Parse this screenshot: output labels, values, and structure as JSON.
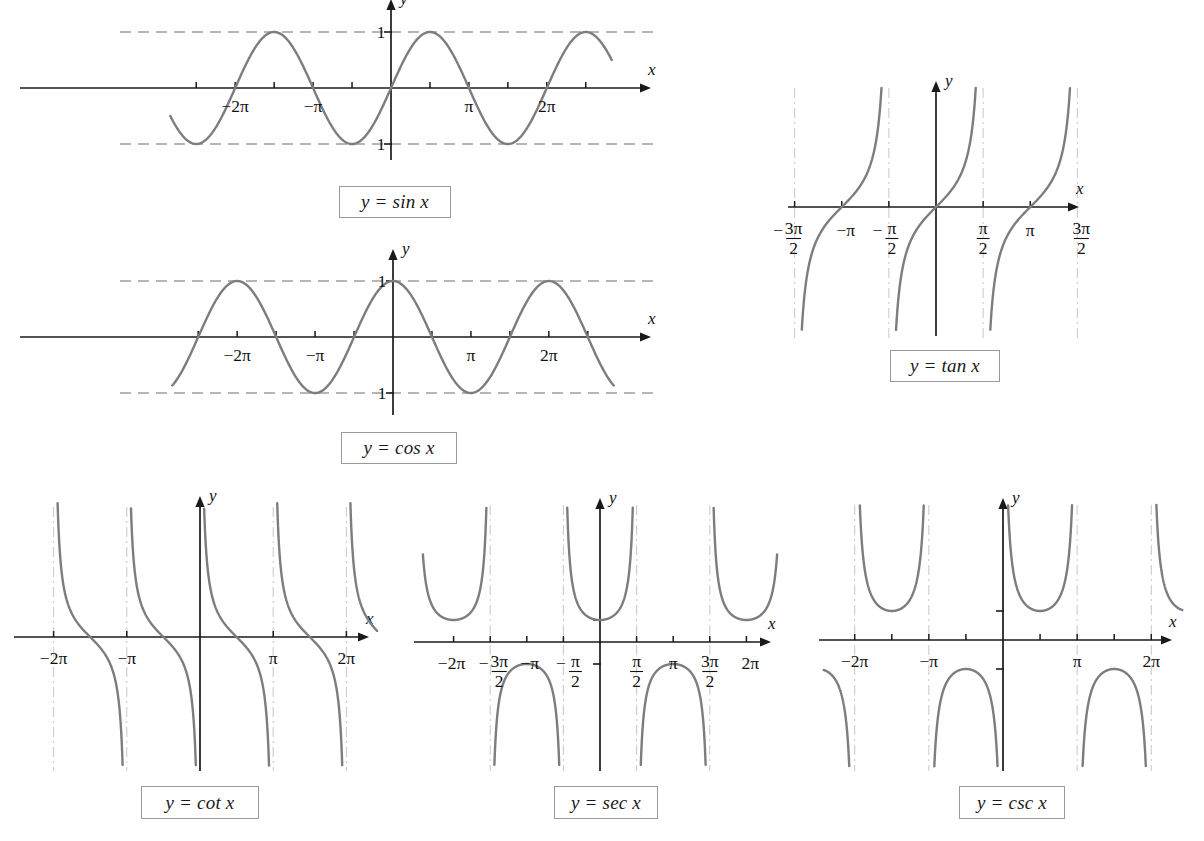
{
  "page": {
    "background": "#ffffff",
    "curve_color": "#7d7d7d",
    "axis_color": "#1a1a1a",
    "asymptote_color": "#c8c8c8",
    "dash_color": "#9d9d9d",
    "width": 1204,
    "height": 841
  },
  "figures": [
    {
      "id": "sine",
      "label": "y = sin x",
      "x_axis_letter": "x",
      "y_axis_letter": "y",
      "tick_labels": [
        "−2π",
        "−π",
        "π",
        "2π"
      ],
      "y_tick_labels": [
        "1",
        "−1"
      ]
    },
    {
      "id": "cosine",
      "label": "y = cos x",
      "x_axis_letter": "x",
      "y_axis_letter": "y",
      "tick_labels": [
        "−2π",
        "−π",
        "π",
        "2π"
      ],
      "y_tick_labels": [
        "1",
        "−1"
      ]
    },
    {
      "id": "tangent",
      "label": "y = tan x",
      "x_axis_letter": "x",
      "y_axis_letter": "y",
      "tick_labels": [
        "− 3π/2",
        "−π",
        "− π/2",
        "π/2",
        "π",
        "3π/2"
      ]
    },
    {
      "id": "cotangent",
      "label": "y = cot x",
      "x_axis_letter": "x",
      "y_axis_letter": "y",
      "tick_labels": [
        "−2π",
        "−π",
        "π",
        "2π"
      ]
    },
    {
      "id": "secant",
      "label": "y = sec x",
      "x_axis_letter": "x",
      "y_axis_letter": "y",
      "tick_labels": [
        "−2π",
        "− 3π/2",
        "−π",
        "− π/2",
        "π/2",
        "π",
        "3π/2",
        "2π"
      ]
    },
    {
      "id": "cosecant",
      "label": "y = csc x",
      "x_axis_letter": "x",
      "y_axis_letter": "y",
      "tick_labels": [
        "−2π",
        "−π",
        "π",
        "2π"
      ]
    }
  ],
  "chart_data": [
    {
      "type": "line",
      "id": "sine",
      "title": "y = sin x",
      "function": "sin",
      "xlabel": "x",
      "ylabel": "y",
      "xlim": [
        -8.9,
        8.9
      ],
      "ylim": [
        -1.6,
        1.6
      ],
      "xticks": [
        -7.854,
        -6.283,
        -4.712,
        -3.142,
        -1.571,
        1.571,
        3.142,
        4.712,
        6.283,
        7.854
      ],
      "xtick_labels": [
        "",
        "−2π",
        "",
        "−π",
        "",
        "",
        "π",
        "",
        "2π",
        ""
      ],
      "yticks": [
        -1,
        1
      ],
      "ytick_labels": [
        "−1",
        "1"
      ],
      "guide_lines": [
        1,
        -1
      ],
      "guide_style": "dashed",
      "asymptotes": [],
      "grid": false,
      "legend": false,
      "zeros": [
        -6.283,
        -3.142,
        0,
        3.142,
        6.283
      ],
      "maxima": [
        -4.712,
        1.571,
        7.854
      ],
      "minima": [
        -7.854,
        -1.571,
        4.712
      ]
    },
    {
      "type": "line",
      "id": "cosine",
      "title": "y = cos x",
      "function": "cos",
      "xlabel": "x",
      "ylabel": "y",
      "xlim": [
        -8.9,
        8.9
      ],
      "ylim": [
        -1.6,
        1.6
      ],
      "xticks": [
        -7.854,
        -6.283,
        -4.712,
        -3.142,
        -1.571,
        1.571,
        3.142,
        4.712,
        6.283,
        7.854
      ],
      "xtick_labels": [
        "",
        "−2π",
        "",
        "−π",
        "",
        "",
        "π",
        "",
        "2π",
        ""
      ],
      "yticks": [
        -1,
        1
      ],
      "ytick_labels": [
        "−1",
        "1"
      ],
      "guide_lines": [
        1,
        -1
      ],
      "guide_style": "dashed",
      "asymptotes": [],
      "grid": false,
      "legend": false,
      "zeros": [
        -7.854,
        -4.712,
        -1.571,
        1.571,
        4.712,
        7.854
      ],
      "maxima": [
        -6.283,
        0,
        6.283
      ],
      "minima": [
        -3.142,
        3.142
      ]
    },
    {
      "type": "line",
      "id": "tangent",
      "title": "y = tan x",
      "function": "tan",
      "xlabel": "x",
      "ylabel": "y",
      "xlim": [
        -5.3,
        5.3
      ],
      "ylim": [
        -4.7,
        4.7
      ],
      "xticks": [
        -4.712,
        -3.142,
        -1.571,
        1.571,
        3.142,
        4.712
      ],
      "xtick_labels": [
        "− 3π/2",
        "−π",
        "− π/2",
        "π/2",
        "π",
        "3π/2"
      ],
      "yticks": [],
      "ytick_labels": [],
      "guide_lines": [],
      "asymptotes": [
        -4.712,
        -1.571,
        1.571,
        4.712
      ],
      "grid": false,
      "legend": false,
      "zeros": [
        -3.142,
        0,
        3.142
      ]
    },
    {
      "type": "line",
      "id": "cotangent",
      "title": "y = cot x",
      "function": "cot",
      "xlabel": "x",
      "ylabel": "y",
      "xlim": [
        -7.6,
        7.6
      ],
      "ylim": [
        -4.6,
        4.6
      ],
      "xticks": [
        -6.283,
        -3.142,
        3.142,
        6.283
      ],
      "xtick_labels": [
        "−2π",
        "−π",
        "π",
        "2π"
      ],
      "yticks": [],
      "ytick_labels": [],
      "guide_lines": [],
      "asymptotes": [
        -6.283,
        -3.142,
        0,
        3.142,
        6.283
      ],
      "grid": false,
      "legend": false,
      "zeros": [
        -4.712,
        -1.571,
        1.571,
        4.712
      ]
    },
    {
      "type": "line",
      "id": "secant",
      "title": "y = sec x",
      "function": "sec",
      "xlabel": "x",
      "ylabel": "y",
      "xlim": [
        -7.6,
        7.6
      ],
      "ylim": [
        -5.2,
        5.2
      ],
      "xticks": [
        -6.283,
        -4.712,
        -3.142,
        -1.571,
        1.571,
        3.142,
        4.712,
        6.283
      ],
      "xtick_labels": [
        "−2π",
        "− 3π/2",
        "−π",
        "− π/2",
        "π/2",
        "π",
        "3π/2",
        "2π"
      ],
      "yticks": [
        -1,
        1
      ],
      "ytick_labels": [
        "",
        ""
      ],
      "guide_lines": [],
      "asymptotes": [
        -4.712,
        -1.571,
        1.571,
        4.712
      ],
      "grid": false,
      "legend": false,
      "minima_positive": [
        -6.283,
        0,
        6.283
      ],
      "maxima_negative": [
        -3.142,
        3.142
      ]
    },
    {
      "type": "line",
      "id": "cosecant",
      "title": "y = csc x",
      "function": "csc",
      "xlabel": "x",
      "ylabel": "y",
      "xlim": [
        -7.6,
        7.6
      ],
      "ylim": [
        -5.2,
        5.2
      ],
      "xticks": [
        -6.283,
        -4.712,
        -3.142,
        -1.571,
        1.571,
        3.142,
        4.712,
        6.283
      ],
      "xtick_labels": [
        "−2π",
        "",
        "−π",
        "",
        "",
        "π",
        "",
        "2π"
      ],
      "yticks": [
        -1,
        1
      ],
      "ytick_labels": [
        "",
        ""
      ],
      "guide_lines": [],
      "asymptotes": [
        -6.283,
        -3.142,
        0,
        3.142,
        6.283
      ],
      "grid": false,
      "legend": false,
      "minima_positive": [
        -4.712,
        1.571
      ],
      "maxima_negative": [
        -1.571,
        4.712
      ]
    }
  ]
}
